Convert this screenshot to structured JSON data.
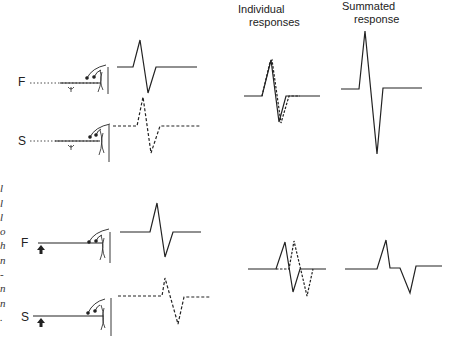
{
  "headers": {
    "individual": [
      "Individual",
      "responses"
    ],
    "summated": [
      "Summated",
      "response"
    ]
  },
  "panels": {
    "top": {
      "fiber_labels": [
        "F",
        "S"
      ],
      "stimulus_marker": "ψ"
    },
    "bottom": {
      "fiber_labels": [
        "F",
        "S"
      ],
      "stimulus_marker": "arrow-up"
    }
  },
  "left_margin_text": [
    "l",
    "l",
    "l",
    "o",
    "h",
    "n",
    "-",
    "n",
    "n",
    "."
  ],
  "colors": {
    "line": "#222222",
    "background": "#ffffff"
  }
}
